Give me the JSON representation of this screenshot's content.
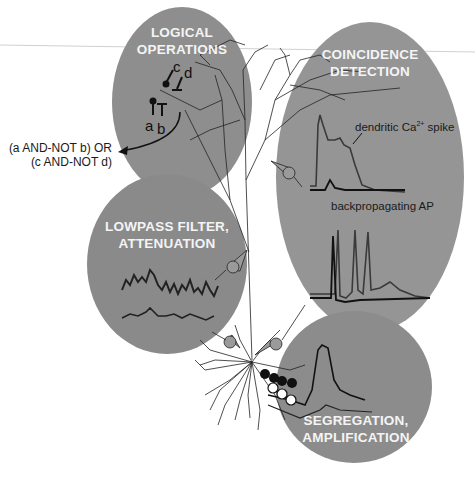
{
  "colors": {
    "ellipse_fill": "#8c8c8c",
    "ellipse_fill_light": "#989898",
    "label_text": "#f4f4f4",
    "trace_dark": "#111111",
    "trace_gray": "#3a3a3a",
    "background": "#ffffff"
  },
  "panels": {
    "logical": {
      "title_line1": "LOGICAL",
      "title_line2": "OPERATIONS",
      "synapse_labels": [
        "c",
        "d",
        "a",
        "b"
      ],
      "output_line1": "(a AND-NOT b) OR",
      "output_line2": "(c AND-NOT d)"
    },
    "coincidence": {
      "title_line1": "COINCIDENCE",
      "title_line2": "DETECTION",
      "trace1_label_pre": "dendritic Ca",
      "trace1_label_sup": "2+",
      "trace1_label_post": " spike",
      "trace2_label": "backpropagating AP"
    },
    "lowpass": {
      "title_line1": "LOWPASS FILTER,",
      "title_line2": "ATTENUATION"
    },
    "segregation": {
      "title_line1": "SEGREGATION,",
      "title_line2": "AMPLIFICATION"
    }
  },
  "icons": {
    "electrode": "electrode-icon",
    "excitatory_synapse": "filled-circle",
    "inhibitory_synapse": "t-bar"
  }
}
